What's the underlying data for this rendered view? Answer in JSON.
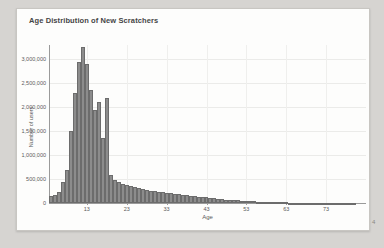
{
  "page": {
    "background": "#d6d4d1",
    "page_marker": "4"
  },
  "card": {
    "title": "Age Distribution of New Scratchers"
  },
  "chart_data": {
    "type": "bar",
    "title": "Age Distribution of New Scratchers",
    "xlabel": "Age",
    "ylabel": "Number of users",
    "xlim": [
      3.5,
      83
    ],
    "ylim": [
      0,
      3300000
    ],
    "x_ticks": [
      13,
      23,
      33,
      43,
      53,
      63,
      73
    ],
    "y_ticks": [
      0,
      500000,
      1000000,
      1500000,
      2000000,
      2500000,
      3000000
    ],
    "y_tick_labels": [
      "0",
      "500,000",
      "1,000,000",
      "1,500,000",
      "2,000,000",
      "2,500,000",
      "3,000,000"
    ],
    "grid": true,
    "legend": "none",
    "bar_color": "#8c8c8c",
    "bar_border_color": "#6c6c6c",
    "ages": [
      4,
      5,
      6,
      7,
      8,
      9,
      10,
      11,
      12,
      13,
      14,
      15,
      16,
      17,
      18,
      19,
      20,
      21,
      22,
      23,
      24,
      25,
      26,
      27,
      28,
      29,
      30,
      31,
      32,
      33,
      34,
      35,
      36,
      37,
      38,
      39,
      40,
      41,
      42,
      43,
      44,
      45,
      46,
      47,
      48,
      49,
      50,
      51,
      52,
      53,
      54,
      55,
      56,
      57,
      58,
      59,
      60,
      61,
      62,
      63,
      64,
      65,
      66,
      67,
      68,
      69,
      70,
      71,
      72,
      73,
      74,
      75,
      76,
      77,
      78,
      79,
      80
    ],
    "values": [
      140000,
      165000,
      230000,
      430000,
      690000,
      1500000,
      2300000,
      2950000,
      3250000,
      2900000,
      2350000,
      1950000,
      2100000,
      1350000,
      2200000,
      590000,
      490000,
      440000,
      400000,
      370000,
      350000,
      330000,
      315000,
      295000,
      280000,
      260000,
      250000,
      240000,
      230000,
      215000,
      205000,
      195000,
      185000,
      175000,
      165000,
      155000,
      145000,
      135000,
      125000,
      115000,
      105000,
      95000,
      88000,
      80000,
      73000,
      66000,
      60000,
      54000,
      48000,
      43000,
      38000,
      34000,
      30000,
      26000,
      23000,
      20000,
      18000,
      15000,
      13000,
      11000,
      10000,
      9000,
      8000,
      7000,
      6000,
      5000,
      5000,
      4000,
      4000,
      3000,
      3000,
      2000,
      2000,
      2000,
      1000,
      1000,
      1000
    ]
  }
}
